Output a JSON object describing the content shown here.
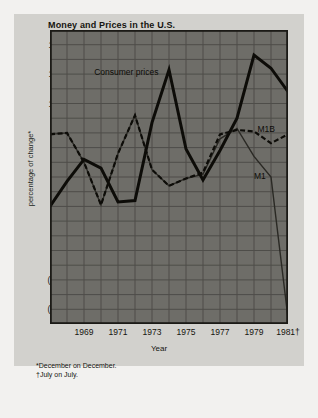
{
  "chart_data": {
    "type": "line",
    "title": "Money and Prices in the U.S.",
    "xlabel": "Year",
    "ylabel": "percentage of change*",
    "xlim": [
      1967,
      1981
    ],
    "ylim": [
      -5,
      15
    ],
    "grid": true,
    "legend_position": "inline-annotations",
    "yticks": [
      "14",
      "12",
      "10",
      "8",
      "6",
      "4",
      "2",
      "0",
      "(2)",
      "(4)"
    ],
    "ytick_values": [
      14,
      12,
      10,
      8,
      6,
      4,
      2,
      0,
      -2,
      -4
    ],
    "xticks": [
      "1969",
      "1971",
      "1973",
      "1975",
      "1977",
      "1979",
      "1981†"
    ],
    "xtick_values": [
      1969,
      1971,
      1973,
      1975,
      1977,
      1979,
      1981
    ],
    "x": [
      1967,
      1968,
      1969,
      1970,
      1971,
      1972,
      1973,
      1974,
      1975,
      1976,
      1977,
      1978,
      1979,
      1980,
      1981
    ],
    "series": [
      {
        "name": "Consumer prices",
        "style": "thick-solid",
        "color": "#0d0c08",
        "values": [
          3.0,
          4.7,
          6.2,
          5.6,
          3.3,
          3.4,
          8.7,
          12.3,
          6.9,
          4.8,
          6.8,
          9.0,
          13.3,
          12.4,
          10.8
        ]
      },
      {
        "name": "M1B",
        "style": "dashed",
        "color": "#0d0c08",
        "values": [
          7.9,
          8.0,
          6.0,
          3.1,
          6.6,
          9.2,
          5.5,
          4.4,
          4.9,
          5.3,
          7.9,
          8.2,
          8.1,
          7.3,
          7.9
        ]
      },
      {
        "name": "M1",
        "style": "thin-solid",
        "color": "#2a2924",
        "values": [
          7.9,
          8.0,
          6.0,
          3.1,
          6.6,
          9.2,
          5.5,
          4.4,
          4.9,
          5.2,
          7.6,
          8.3,
          6.4,
          5.0,
          -4.6
        ]
      }
    ],
    "annotations": [
      {
        "text": "Consumer prices",
        "x": 1969.6,
        "y": 12.1
      },
      {
        "text": "M1B",
        "x": 1979.2,
        "y": 8.2
      },
      {
        "text": "M1",
        "x": 1979.0,
        "y": 5.0
      }
    ],
    "footnotes": [
      "*December on December.",
      "†July on July."
    ],
    "colors": {
      "page_background": "#f2f1ef",
      "card_background": "#d2d1cd",
      "plot_background": "#6e6d68",
      "grid": "#4e4d49",
      "frame": "#1b1a16",
      "ink": "#15140f"
    }
  }
}
